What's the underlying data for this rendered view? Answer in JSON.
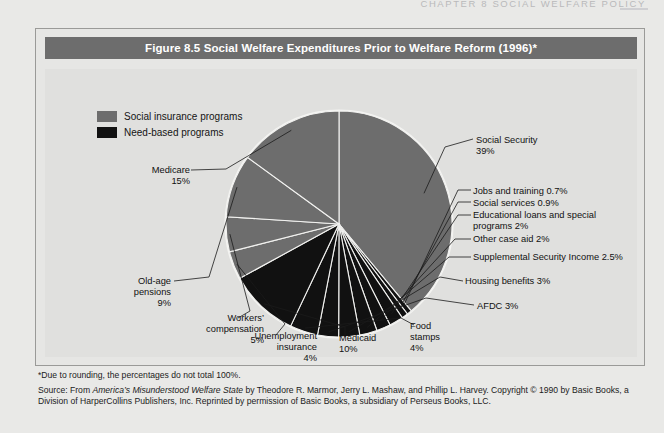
{
  "page": {
    "running_head": "CHAPTER 8  SOCIAL WELFARE POLICY",
    "background_color": "#e9e9e7"
  },
  "figure": {
    "title": "Figure 8.5  Social Welfare Expenditures Prior to Welfare Reform (1996)*",
    "title_bar_color": "#6d6d6d",
    "panel_color": "#e0e0de"
  },
  "legend": {
    "items": [
      {
        "label": "Social insurance programs",
        "color": "#6d6d6d",
        "swatch_name": "social-insurance-swatch"
      },
      {
        "label": "Need-based programs",
        "color": "#111111",
        "swatch_name": "need-based-swatch"
      }
    ]
  },
  "notes": {
    "footnote": "*Due to rounding, the percentages do not total 100%.",
    "source_prefix": "Source: From ",
    "source_title": "America’s Misunderstood Welfare State",
    "source_rest": " by Theodore R. Marmor, Jerry L. Mashaw, and Phillip L. Harvey. Copyright © 1990 by Basic Books, a Division",
    "source_line2": "of HarperCollins Publishers, Inc. Reprinted by permission of Basic Books, a subsidiary of Perseus Books, LLC."
  },
  "chart_data": {
    "type": "pie",
    "title": "Figure 8.5  Social Welfare Expenditures Prior to Welfare Reform (1996)*",
    "note": "*Due to rounding, the percentages do not total 100%.",
    "legend": [
      "Social insurance programs",
      "Need-based programs"
    ],
    "legend_position": "top-left",
    "colors": {
      "social_insurance": "#6d6d6d",
      "need_based": "#111111",
      "separator": "#f2f2f0"
    },
    "start_angle_deg": 0,
    "direction": "clockwise",
    "total_percent": 96.1,
    "labels": [
      "Social Security",
      "Jobs and training",
      "Social services",
      "Educational loans and special programs",
      "Other case aid",
      "Supplemental Security Income",
      "Housing benefits",
      "AFDC",
      "Food stamps",
      "Medicaid",
      "Unemployment insurance",
      "Workers’ compensation",
      "Old-age pensions",
      "Medicare"
    ],
    "values": [
      39,
      0.7,
      0.9,
      2,
      2,
      2.5,
      3,
      3,
      4,
      10,
      4,
      5,
      9,
      15
    ],
    "slices": [
      {
        "label": "Social Security",
        "value": 39,
        "value_text": "39%",
        "category": "social insurance",
        "color": "#6d6d6d"
      },
      {
        "label": "Jobs and training",
        "value": 0.7,
        "value_text": "0.7%",
        "category": "need-based",
        "color": "#111111"
      },
      {
        "label": "Social services",
        "value": 0.9,
        "value_text": "0.9%",
        "category": "need-based",
        "color": "#111111"
      },
      {
        "label": "Educational loans and special programs",
        "value": 2,
        "value_text": "2%",
        "category": "need-based",
        "color": "#111111"
      },
      {
        "label": "Other case aid",
        "value": 2,
        "value_text": "2%",
        "category": "need-based",
        "color": "#111111"
      },
      {
        "label": "Supplemental Security Income",
        "value": 2.5,
        "value_text": "2.5%",
        "category": "need-based",
        "color": "#111111"
      },
      {
        "label": "Housing benefits",
        "value": 3,
        "value_text": "3%",
        "category": "need-based",
        "color": "#111111"
      },
      {
        "label": "AFDC",
        "value": 3,
        "value_text": "3%",
        "category": "need-based",
        "color": "#111111"
      },
      {
        "label": "Food stamps",
        "value": 4,
        "value_text": "4%",
        "category": "need-based",
        "color": "#111111"
      },
      {
        "label": "Medicaid",
        "value": 10,
        "value_text": "10%",
        "category": "need-based",
        "color": "#111111"
      },
      {
        "label": "Unemployment insurance",
        "value": 4,
        "value_text": "4%",
        "category": "social insurance",
        "color": "#6d6d6d"
      },
      {
        "label": "Workers’ compensation",
        "value": 5,
        "value_text": "5%",
        "category": "social insurance",
        "color": "#6d6d6d"
      },
      {
        "label": "Old-age pensions",
        "value": 9,
        "value_text": "9%",
        "category": "social insurance",
        "color": "#6d6d6d"
      },
      {
        "label": "Medicare",
        "value": 15,
        "value_text": "15%",
        "category": "social insurance",
        "color": "#6d6d6d"
      }
    ]
  },
  "callouts": {
    "social_security": "Social Security\n39%",
    "jobs_training": "Jobs and training 0.7%",
    "social_services": "Social services 0.9%",
    "educational_loans": "Educational loans and special\nprograms 2%",
    "other_case_aid": "Other case aid 2%",
    "ssi": "Supplemental Security Income 2.5%",
    "housing": "Housing benefits 3%",
    "afdc": "AFDC 3%",
    "food_stamps": "Food\nstamps\n4%",
    "medicaid": "Medicaid\n10%",
    "unemployment": "Unemployment\ninsurance\n4%",
    "workers_comp": "Workers’\ncompensation\n5%",
    "old_age": "Old-age\npensions\n9%",
    "medicare": "Medicare\n15%"
  }
}
